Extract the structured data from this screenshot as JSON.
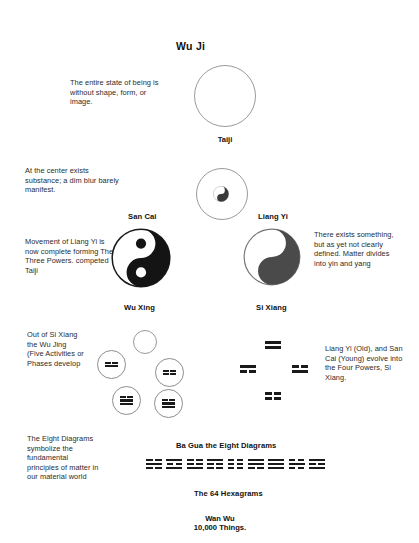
{
  "title": "Wu Ji",
  "stages": {
    "wuji_circle_label": "Taiji",
    "san_cai": "San Cai",
    "liang_yi": "Liang Yi",
    "wu_xing": "Wu Xing",
    "si_xiang": "Si Xiang",
    "ba_gua": "Ba Gua the Eight Diagrams",
    "hexagrams": "The 64 Hexagrams",
    "wan_wu": "Wan Wu",
    "wan_wu_sub": "10,000 Things."
  },
  "annotations": {
    "wuji": "The entire state of being is without shape, form, or image.",
    "taiji": "At the center exists substance; a dim blur barely manifest.",
    "wu_xing_left": "Movement of Liang Yi is now complete forming The Three Powers. competed Taiji",
    "liang_yi_right": "There exists something, but as yet not clearly defined. Matter divides into yin and yang",
    "si_xiang_left": "Out of Si Xiang the Wu Jing (Five Activities or Phases develop",
    "si_xiang_right": "Liang Yi (Old), and San Cai (Young) evolve into the Four Powers, Si Xiang.",
    "ba_gua_left": "The Eight Diagrams symbolize the fundamental principles of matter in our material world"
  },
  "colors": {
    "ink": "#1a1a1a",
    "text": "#2b2b2b",
    "stroke": "#9a9a9a",
    "background": "#ffffff"
  },
  "wu_xing_nodes": [
    {
      "name": "wu-xing-node-1",
      "lines": [
        "yin",
        "yang"
      ]
    },
    {
      "name": "wu-xing-node-2",
      "lines": [
        "yin",
        "yin"
      ]
    },
    {
      "name": "wu-xing-node-3",
      "lines": [
        "yin",
        "yang",
        "yang"
      ]
    },
    {
      "name": "wu-xing-node-4",
      "lines": [
        "yin",
        "yang",
        "yang"
      ]
    }
  ],
  "si_xiang_bigrams": [
    {
      "name": "si-xiang-top",
      "position": "top",
      "lines": [
        "yang",
        "yang"
      ]
    },
    {
      "name": "si-xiang-left",
      "position": "left",
      "lines": [
        "yang",
        "yin"
      ]
    },
    {
      "name": "si-xiang-right",
      "position": "right",
      "lines": [
        "yin",
        "yang"
      ]
    },
    {
      "name": "si-xiang-bottom",
      "position": "bottom",
      "lines": [
        "yin",
        "yin"
      ]
    }
  ],
  "ba_gua_trigrams": [
    {
      "name": "trigram-1",
      "lines": [
        "yin",
        "yang",
        "yin"
      ]
    },
    {
      "name": "trigram-2",
      "lines": [
        "yang",
        "yin",
        "yang"
      ]
    },
    {
      "name": "trigram-3",
      "lines": [
        "yin",
        "yin",
        "yang"
      ]
    },
    {
      "name": "trigram-4",
      "lines": [
        "yang",
        "yin",
        "yin"
      ]
    },
    {
      "name": "trigram-5",
      "lines": [
        "yin",
        "yin",
        "yin"
      ]
    },
    {
      "name": "trigram-6",
      "lines": [
        "yang",
        "yang",
        "yin"
      ]
    },
    {
      "name": "trigram-7",
      "lines": [
        "yang",
        "yang",
        "yang"
      ]
    },
    {
      "name": "trigram-8",
      "lines": [
        "yin",
        "yang",
        "yin"
      ]
    },
    {
      "name": "trigram-9",
      "lines": [
        "yang",
        "yin",
        "yang"
      ]
    }
  ]
}
